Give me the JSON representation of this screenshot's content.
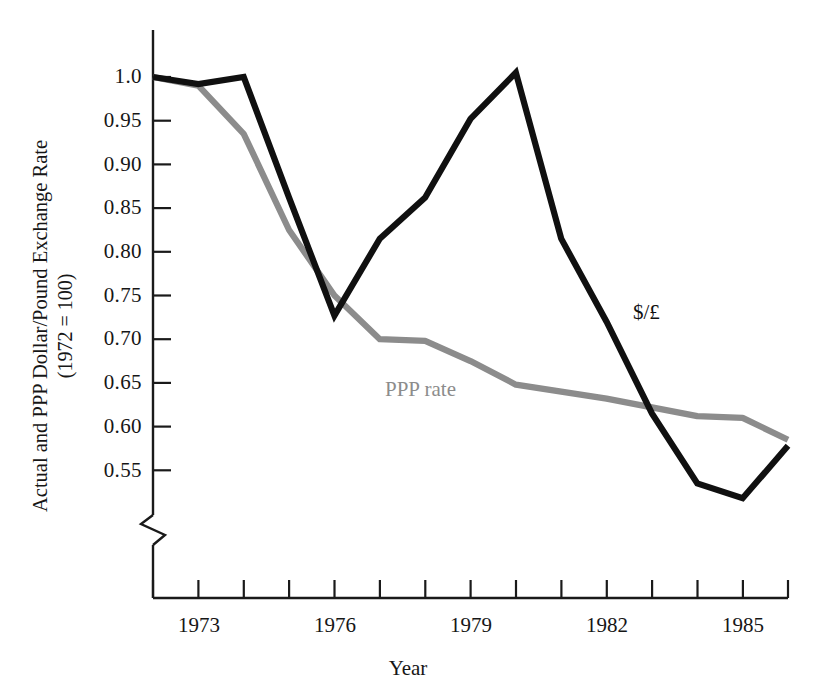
{
  "chart_data": {
    "type": "line",
    "title": "",
    "xlabel": "Year",
    "ylabel": "Actual and PPP Dollar/Pound Exchange Rate (1972 = 100)",
    "ylabel_line1": "Actual and PPP Dollar/Pound Exchange Rate",
    "ylabel_line2": "(1972 = 100)",
    "x": [
      1972,
      1973,
      1974,
      1975,
      1976,
      1977,
      1978,
      1979,
      1980,
      1981,
      1982,
      1983,
      1984,
      1985,
      1986
    ],
    "xlim": [
      1972,
      1986
    ],
    "ylim": [
      0.52,
      1.01
    ],
    "grid": false,
    "axis_break": true,
    "axis_break_note": "y-axis broken below 0.55",
    "legend_position": "inline-annotations",
    "y_ticks": [
      1.0,
      0.95,
      0.9,
      0.85,
      0.8,
      0.75,
      0.7,
      0.65,
      0.6,
      0.55
    ],
    "y_tick_labels": [
      "1.0",
      "0.95",
      "0.90",
      "0.85",
      "0.80",
      "0.75",
      "0.70",
      "0.65",
      "0.60",
      "0.55"
    ],
    "x_ticks": [
      1972,
      1973,
      1974,
      1975,
      1976,
      1977,
      1978,
      1979,
      1980,
      1981,
      1982,
      1983,
      1984,
      1985,
      1986
    ],
    "x_tick_labels": [
      "",
      "1973",
      "",
      "",
      "1976",
      "",
      "",
      "1979",
      "",
      "",
      "1982",
      "",
      "",
      "1985",
      ""
    ],
    "series": [
      {
        "name": "$/£",
        "label": "$/£",
        "color": "#101010",
        "values": [
          1.0,
          0.992,
          1.0,
          0.862,
          0.727,
          0.815,
          0.862,
          0.952,
          1.005,
          0.815,
          0.72,
          0.615,
          0.535,
          0.518,
          0.578
        ]
      },
      {
        "name": "PPP rate",
        "label": "PPP rate",
        "color": "#8c8c8c",
        "values": [
          1.0,
          0.99,
          0.935,
          0.825,
          0.75,
          0.7,
          0.698,
          0.675,
          0.648,
          0.64,
          0.632,
          0.622,
          0.612,
          0.61,
          0.585
        ]
      }
    ]
  },
  "axes": {
    "y_tick_labels": [
      "1.0",
      "0.95",
      "0.90",
      "0.85",
      "0.80",
      "0.75",
      "0.70",
      "0.65",
      "0.60",
      "0.55"
    ],
    "x_tick_labels": [
      "1973",
      "1976",
      "1979",
      "1982",
      "1985"
    ],
    "x_title": "Year",
    "y_title_line1": "Actual and PPP Dollar/Pound Exchange Rate",
    "y_title_line2": "(1972 = 100)"
  },
  "annotations": {
    "actual": "$/£",
    "ppp": "PPP rate"
  },
  "colors": {
    "actual_line": "#101010",
    "ppp_line": "#8c8c8c",
    "axis": "#1a1a1a",
    "background": "#ffffff"
  }
}
